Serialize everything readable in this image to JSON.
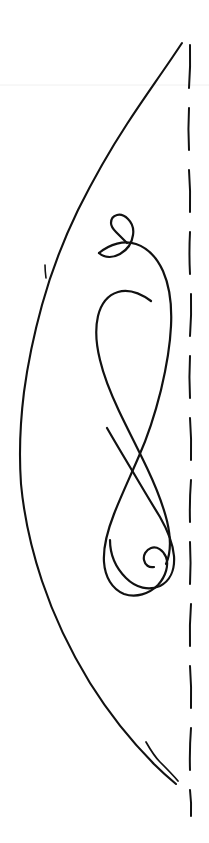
{
  "page": {
    "title": "Hand-drawn ink sketch",
    "width": 209,
    "height": 843,
    "background_color": "#ffffff",
    "description": "A monochrome pen-and-ink line drawing: a tall leaf-like outer arc on the left, an interlaced double-loop flourish with spiral curls at top and bottom in the middle, and a vertical dashed line along the right edge."
  },
  "colors": {
    "ink": "#111111",
    "faint_rule": "#f0f0f0",
    "paper": "#ffffff"
  },
  "strokes": {
    "outer_arc": {
      "name": "outer-leaf-arc",
      "stroke_width": 2.1,
      "d": "M 182 43 C 176 52 170 61 163 71 C 152 87 140 104 127 124 C 110 150 94 178 78 210 C 62 243 50 276 42 305 C 34 334 28 362 24 392 C 20 424 19 455 21 484 C 24 516 31 548 42 581 C 54 617 71 652 90 683 C 110 715 133 743 155 765 C 163 773 170 779 176 784"
    },
    "outer_arc_tick": {
      "name": "outer-arc-tick-mark",
      "stroke_width": 1.6,
      "d": "M 45 265 C 45 270 45.5 274 46 278"
    },
    "outer_arc_fork": {
      "name": "outer-arc-bottom-fork",
      "stroke_width": 1.7,
      "d": "M 146 742 C 150 749 154 756 160 762 C 166 768 172 774 178 781"
    },
    "top_spiral": {
      "name": "top-spiral-curl",
      "stroke_width": 2.2,
      "d": "M 127 243 C 123 239 119 235 116 232 C 113 229 111 226 111 223 C 111 219 113 216 117 215 C 121 214 125 216 128 219 C 132 223 134 229 133 235 C 132 243 127 250 120 254 C 113 258 105 258 99 253"
    },
    "main_flourish": {
      "name": "interlaced-double-loop",
      "stroke_width": 2.2,
      "d": "M 99 253 C 110 244 124 240 136 244 C 148 248 157 258 163 271 C 170 287 172 306 171 326 C 170 348 166 369 161 390 C 155 414 148 436 139 456 C 130 477 121 496 114 514 C 107 532 103 548 104 562 C 105 577 112 589 124 594 C 136 598 149 594 158 585 C 166 576 169 565 166 557 C 163 550 157 546 151 548 C 146 550 143 555 144 560 C 145 565 149 568 154 567"
    },
    "loop_upper": {
      "name": "upper-inner-loop",
      "stroke_width": 2.2,
      "d": "M 151 301 C 140 293 128 289 118 292 C 108 295 101 304 98 316 C 95 329 96 344 100 360 C 104 377 111 394 119 411 C 128 430 138 449 147 468 C 156 487 163 505 167 521 C 171 538 171 553 166 564"
    },
    "loop_lower": {
      "name": "lower-inner-loop",
      "stroke_width": 2.2,
      "d": "M 107 428 C 115 442 124 457 133 472 C 143 489 152 504 160 517 C 168 531 173 544 174 556 C 175 570 170 581 160 586 C 149 591 136 588 126 578 C 116 568 110 554 110 540"
    },
    "faint_rule": {
      "name": "faint-horizontal-rule",
      "d": "M 0 85 L 209 85"
    }
  },
  "dashed_line": {
    "name": "right-edge-dashed-line",
    "x": 190,
    "stroke_width": 2.0,
    "stroke_color": "#111111",
    "dashes": [
      {
        "y1": 45,
        "y2": 88,
        "x1": 190,
        "x2": 189
      },
      {
        "y1": 108,
        "y2": 150,
        "x1": 189,
        "x2": 189
      },
      {
        "y1": 170,
        "y2": 212,
        "x1": 189,
        "x2": 190
      },
      {
        "y1": 232,
        "y2": 274,
        "x1": 190,
        "x2": 190
      },
      {
        "y1": 294,
        "y2": 336,
        "x1": 191,
        "x2": 190
      },
      {
        "y1": 356,
        "y2": 398,
        "x1": 190,
        "x2": 190
      },
      {
        "y1": 418,
        "y2": 460,
        "x1": 190,
        "x2": 191
      },
      {
        "y1": 480,
        "y2": 522,
        "x1": 191,
        "x2": 190
      },
      {
        "y1": 542,
        "y2": 584,
        "x1": 190,
        "x2": 190
      },
      {
        "y1": 604,
        "y2": 646,
        "x1": 191,
        "x2": 190
      },
      {
        "y1": 666,
        "y2": 708,
        "x1": 190,
        "x2": 191
      },
      {
        "y1": 728,
        "y2": 770,
        "x1": 191,
        "x2": 190
      },
      {
        "y1": 790,
        "y2": 816,
        "x1": 190,
        "x2": 191
      }
    ]
  }
}
